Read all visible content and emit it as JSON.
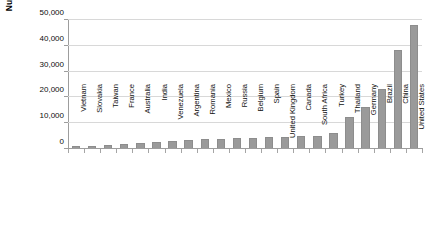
{
  "chart_data": {
    "type": "bar",
    "title": "",
    "xlabel": "",
    "ylabel": "Number of employees",
    "ylim": [
      0,
      50000
    ],
    "ytick_labels": [
      "50,000",
      "40,000",
      "30,000",
      "20,000",
      "10,000",
      "0"
    ],
    "ytick_values": [
      50000,
      40000,
      30000,
      20000,
      10000,
      0
    ],
    "grid": true,
    "legend": "none",
    "series_color": "#9a9a9a",
    "categories": [
      "Vietnam",
      "Slovakia",
      "Taiwan",
      "France",
      "Australia",
      "India",
      "Venezuela",
      "Argentina",
      "Romania",
      "Mexico",
      "Russia",
      "Belgium",
      "Spain",
      "United Kingdom",
      "Canada",
      "South Africa",
      "Turkey",
      "Thailand",
      "Germany",
      "Brazil",
      "China",
      "United States"
    ],
    "values": [
      600,
      800,
      1100,
      1600,
      1900,
      2200,
      2600,
      3100,
      3400,
      3600,
      3800,
      4000,
      4200,
      4300,
      4500,
      4600,
      5800,
      12000,
      16000,
      23000,
      38000,
      47500
    ]
  }
}
